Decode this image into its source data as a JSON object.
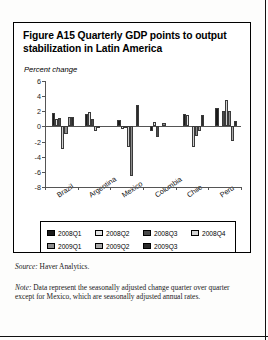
{
  "figure": {
    "title": "Figure A15  Quarterly GDP points to output stabilization in Latin America",
    "axis_label": "Percent change"
  },
  "footnotes": {
    "source_label": "Source:",
    "source_text": " Haver Analytics.",
    "note_label": "Note:",
    "note_text": " Data represent the seasonally adjusted change quarter over quarter except for Mexico, which are seasonally adjusted annual rates."
  },
  "legend": {
    "items": [
      {
        "label": "2008Q1",
        "color": "#1a1a1a"
      },
      {
        "label": "2008Q2",
        "color": "#e2e2e2"
      },
      {
        "label": "2008Q3",
        "color": "#4a4a4a"
      },
      {
        "label": "2008Q4",
        "color": "#d2d2d2"
      },
      {
        "label": "2009Q1",
        "color": "#8c8c8c"
      },
      {
        "label": "2009Q2",
        "color": "#a8a8a8"
      },
      {
        "label": "2009Q3",
        "color": "#2b2b2b"
      }
    ]
  },
  "chart_data": {
    "type": "bar",
    "title": "Figure A15  Quarterly GDP points to output stabilization in Latin America",
    "xlabel": "",
    "ylabel": "Percent change",
    "ylim": [
      -8,
      6
    ],
    "yticks": [
      6,
      4,
      2,
      0,
      -2,
      -4,
      -6,
      -8
    ],
    "ytick_labels": [
      "6",
      "4",
      "2",
      "0",
      "-2",
      "-4",
      "-6",
      "-8"
    ],
    "grid": false,
    "legend_position": "below",
    "categories": [
      "Brazil",
      "Argentina",
      "Mexico",
      "Colombia",
      "Chile",
      "Peru"
    ],
    "series": [
      {
        "name": "2008Q1",
        "color": "#1a1a1a",
        "values": [
          1.8,
          1.7,
          0.8,
          -0.6,
          1.7,
          2.4
        ]
      },
      {
        "name": "2008Q2",
        "color": "#e2e2e2",
        "values": [
          1.0,
          1.9,
          -0.3,
          0.6,
          1.5,
          0.0
        ]
      },
      {
        "name": "2008Q3",
        "color": "#4a4a4a",
        "values": [
          1.1,
          1.0,
          -0.2,
          -1.4,
          0.0,
          2.0
        ]
      },
      {
        "name": "2008Q4",
        "color": "#d2d2d2",
        "values": [
          -3.0,
          -0.6,
          -2.7,
          0.0,
          -2.7,
          3.5
        ]
      },
      {
        "name": "2009Q1",
        "color": "#8c8c8c",
        "values": [
          -1.0,
          -0.1,
          -6.5,
          0.4,
          -1.3,
          2.0
        ]
      },
      {
        "name": "2009Q2",
        "color": "#a8a8a8",
        "values": [
          1.2,
          0.0,
          0.0,
          0.0,
          -0.6,
          -1.9
        ]
      },
      {
        "name": "2009Q3",
        "color": "#2b2b2b",
        "values": [
          1.3,
          0.0,
          2.8,
          0.0,
          1.5,
          0.7
        ]
      }
    ]
  }
}
